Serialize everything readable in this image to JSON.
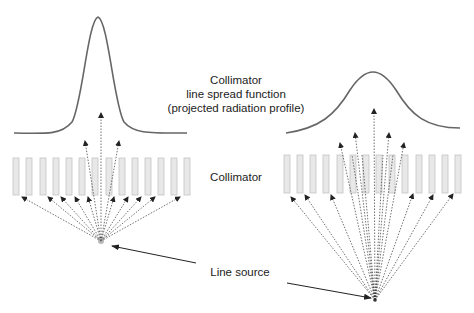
{
  "labels": {
    "lsf_line1": "Collimator",
    "lsf_line2": "line spread function",
    "lsf_line3": "(projected radiation profile)",
    "collimator": "Collimator",
    "line_source": "Line source"
  },
  "colors": {
    "bar_fill": "#e8e8e8",
    "bar_stroke": "#bdbdbd",
    "curve": "#666666",
    "arrow": "#333333"
  },
  "panels": [
    {
      "name": "narrow-profile",
      "bars_x0": 13,
      "bar_pitch": 13.2,
      "bar_count": 14,
      "bar_y": 158,
      "bar_h": 37,
      "source": [
        101,
        241
      ]
    },
    {
      "name": "wide-profile",
      "bars_x0": 284,
      "bar_pitch": 13.2,
      "bar_count": 14,
      "bar_y": 155,
      "bar_h": 38,
      "source": [
        375,
        300
      ]
    }
  ]
}
